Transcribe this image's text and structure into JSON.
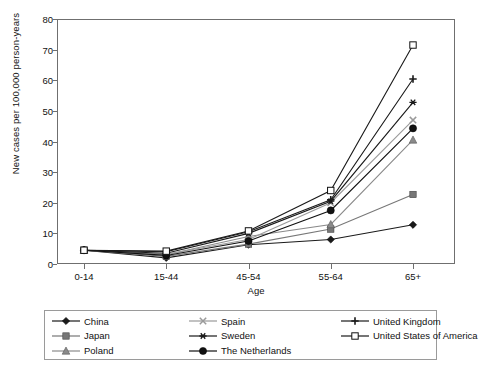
{
  "chart_data": {
    "type": "line",
    "title": "",
    "xlabel": "Age",
    "ylabel": "New cases per 100,000 person-years",
    "categories": [
      "0-14",
      "15-44",
      "45-54",
      "55-64",
      "65+"
    ],
    "ylim": [
      0,
      80
    ],
    "yticks": [
      0,
      10,
      20,
      30,
      40,
      50,
      60,
      70,
      80
    ],
    "grid": false,
    "legend_position": "bottom",
    "series": [
      {
        "name": "China",
        "marker": "filled-diamond",
        "color": "#1a1a1a",
        "values": [
          4.5,
          2.0,
          6.3,
          8.0,
          12.8
        ]
      },
      {
        "name": "Japan",
        "marker": "filled-square",
        "color": "#777777",
        "values": [
          4.5,
          2.5,
          6.5,
          11.4,
          22.7
        ]
      },
      {
        "name": "Poland",
        "marker": "filled-triangle",
        "color": "#8a8a8a",
        "values": [
          4.5,
          3.0,
          9.0,
          12.9,
          40.5
        ]
      },
      {
        "name": "Spain",
        "marker": "cross-x",
        "color": "#9a9a9a",
        "values": [
          4.5,
          3.2,
          8.0,
          20.0,
          47.0
        ]
      },
      {
        "name": "Sweden",
        "marker": "asterisk",
        "color": "#1a1a1a",
        "values": [
          4.5,
          3.5,
          10.0,
          20.5,
          52.8
        ]
      },
      {
        "name": "The Netherlands",
        "marker": "filled-circle",
        "color": "#111111",
        "values": [
          4.5,
          2.8,
          7.5,
          17.5,
          44.3
        ]
      },
      {
        "name": "United Kingdom",
        "marker": "plus",
        "color": "#1a1a1a",
        "values": [
          4.5,
          4.0,
          10.5,
          21.0,
          60.4
        ]
      },
      {
        "name": "United States of America",
        "marker": "open-square",
        "color": "#1a1a1a",
        "values": [
          4.5,
          4.2,
          10.8,
          24.0,
          71.5
        ]
      }
    ]
  },
  "axes": {
    "ylabel": "New cases per 100,000 person-years",
    "xlabel": "Age",
    "yticks": [
      "0",
      "10",
      "20",
      "30",
      "40",
      "50",
      "60",
      "70",
      "80"
    ],
    "xticks": [
      "0-14",
      "15-44",
      "45-54",
      "55-64",
      "65+"
    ]
  },
  "legend": {
    "entries": [
      {
        "label": "China"
      },
      {
        "label": "Japan"
      },
      {
        "label": "Poland"
      },
      {
        "label": "Spain"
      },
      {
        "label": "Sweden"
      },
      {
        "label": "The Netherlands"
      },
      {
        "label": "United Kingdom"
      },
      {
        "label": "United States of America"
      }
    ]
  }
}
